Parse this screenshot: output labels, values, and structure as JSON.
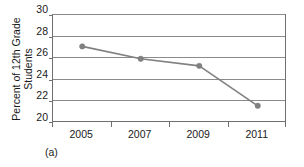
{
  "chart_data": {
    "type": "line",
    "title": "",
    "title_note": "title row is cropped off the top edge of the screenshot",
    "xlabel": "",
    "ylabel": "Percent of 12th Grade Students",
    "ylabel_line1": "Percent of 12th Grade",
    "ylabel_line2": "Students",
    "categories": [
      "2005",
      "2007",
      "2009",
      "2011"
    ],
    "x": [
      2005,
      2007,
      2009,
      2011
    ],
    "values": [
      27.0,
      25.85,
      25.2,
      21.5
    ],
    "series": [
      {
        "name": "Percent of 12th Grade Students",
        "values": [
          27.0,
          25.85,
          25.2,
          21.5
        ]
      }
    ],
    "ylim": [
      20,
      30
    ],
    "yticks": [
      30,
      28,
      26,
      24,
      22,
      20
    ],
    "ytick_labels": [
      "30",
      "28",
      "26",
      "24",
      "22",
      "20"
    ],
    "xtick_labels": [
      "2005",
      "2007",
      "2009",
      "2011"
    ],
    "grid": "horizontal",
    "legend": "none",
    "marker": "circle",
    "line_color": "#808080",
    "marker_color": "#808080",
    "axis_color": "#6f6f6f",
    "gridline_color": "#8a8a8a",
    "background": "#ffffff"
  },
  "caption": {
    "sub_label": "(a)"
  }
}
